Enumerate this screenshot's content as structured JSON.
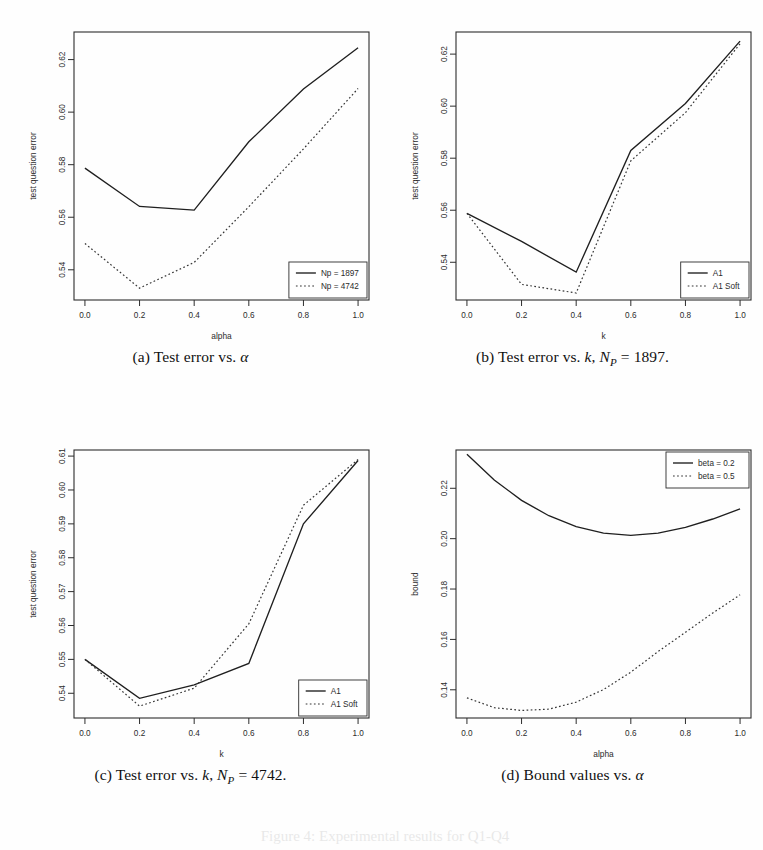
{
  "figure": {
    "background": "#fefefe",
    "ink_color": "#1f1f1f"
  },
  "panels": [
    {
      "id": "a",
      "caption_prefix": "(a)",
      "caption_text": "Test error vs.",
      "caption_symbol": "α",
      "caption_suffix": ""
    },
    {
      "id": "b",
      "caption_prefix": "(b)",
      "caption_text": "Test error vs.",
      "caption_symbol": "k",
      "caption_suffix": "1897."
    },
    {
      "id": "c",
      "caption_prefix": "(c)",
      "caption_text": "Test error vs.",
      "caption_symbol": "k",
      "caption_suffix": "4742."
    },
    {
      "id": "d",
      "caption_prefix": "(d)",
      "caption_text": "Bound values vs.",
      "caption_symbol": "α",
      "caption_suffix": ""
    }
  ],
  "caption_np_var": "N",
  "caption_np_sub": "P",
  "caption_eq": "=",
  "bottom_bleed_text": "Figure 4: Experimental results for Q1-Q4",
  "chart_data": [
    {
      "id": "a",
      "type": "line",
      "title": "",
      "xlabel": "alpha",
      "ylabel": "test question error",
      "x": [
        0.0,
        0.2,
        0.4,
        0.6,
        0.8,
        1.0
      ],
      "xticks": [
        "0.0",
        "0.2",
        "0.4",
        "0.6",
        "0.8",
        "1.0"
      ],
      "yticks": [
        "0.54",
        "0.56",
        "0.58",
        "0.60",
        "0.62"
      ],
      "ytickvals": [
        0.54,
        0.56,
        0.58,
        0.6,
        0.62
      ],
      "xlim": [
        -0.04,
        1.04
      ],
      "ylim": [
        0.5285,
        0.6305
      ],
      "grid": false,
      "legend_position": "bottom-right",
      "series": [
        {
          "name": "Np = 1897",
          "style": "solid",
          "values": [
            0.5787,
            0.5641,
            0.5627,
            0.5887,
            0.6088,
            0.6245
          ]
        },
        {
          "name": "Np = 4742",
          "style": "dotted",
          "values": [
            0.55,
            0.533,
            0.5428,
            0.564,
            0.586,
            0.609
          ]
        }
      ]
    },
    {
      "id": "b",
      "type": "line",
      "title": "",
      "xlabel": "k",
      "ylabel": "test question error",
      "x": [
        0.0,
        0.2,
        0.4,
        0.6,
        0.8,
        1.0
      ],
      "xticks": [
        "0.0",
        "0.2",
        "0.4",
        "0.6",
        "0.8",
        "1.0"
      ],
      "yticks": [
        "0.54",
        "0.56",
        "0.58",
        "0.60",
        "0.62"
      ],
      "ytickvals": [
        0.54,
        0.56,
        0.58,
        0.6,
        0.62
      ],
      "xlim": [
        -0.04,
        1.04
      ],
      "ylim": [
        0.5255,
        0.6285
      ],
      "grid": false,
      "legend_position": "bottom-right",
      "series": [
        {
          "name": "A1",
          "style": "solid",
          "values": [
            0.5588,
            0.548,
            0.5362,
            0.583,
            0.601,
            0.625
          ]
        },
        {
          "name": "A1 Soft",
          "style": "dotted",
          "values": [
            0.5588,
            0.5315,
            0.5282,
            0.579,
            0.5975,
            0.624
          ]
        }
      ]
    },
    {
      "id": "c",
      "type": "line",
      "title": "",
      "xlabel": "k",
      "ylabel": "test question error",
      "x": [
        0.0,
        0.2,
        0.4,
        0.6,
        0.8,
        1.0
      ],
      "xticks": [
        "0.0",
        "0.2",
        "0.4",
        "0.6",
        "0.8",
        "1.0"
      ],
      "yticks": [
        "0.54",
        "0.55",
        "0.56",
        "0.57",
        "0.58",
        "0.59",
        "0.60",
        "0.61"
      ],
      "ytickvals": [
        0.54,
        0.55,
        0.56,
        0.57,
        0.58,
        0.59,
        0.6,
        0.61
      ],
      "xlim": [
        -0.04,
        1.04
      ],
      "ylim": [
        0.5327,
        0.6118
      ],
      "grid": false,
      "legend_position": "bottom-right",
      "series": [
        {
          "name": "A1",
          "style": "solid",
          "values": [
            0.55,
            0.5385,
            0.5425,
            0.5488,
            0.59,
            0.6087
          ]
        },
        {
          "name": "A1 Soft",
          "style": "dotted",
          "values": [
            0.55,
            0.5362,
            0.5415,
            0.5605,
            0.5955,
            0.609
          ]
        }
      ]
    },
    {
      "id": "d",
      "type": "line",
      "title": "",
      "xlabel": "alpha",
      "ylabel": "bound",
      "x": [
        0.0,
        0.1,
        0.2,
        0.3,
        0.4,
        0.5,
        0.6,
        0.7,
        0.8,
        0.9,
        1.0
      ],
      "xticks": [
        "0.0",
        "0.2",
        "0.4",
        "0.6",
        "0.8",
        "1.0"
      ],
      "xtickvals": [
        0.0,
        0.2,
        0.4,
        0.6,
        0.8,
        1.0
      ],
      "yticks": [
        "0.14",
        "0.16",
        "0.18",
        "0.20",
        "0.22"
      ],
      "ytickvals": [
        0.14,
        0.16,
        0.18,
        0.2,
        0.22
      ],
      "xlim": [
        -0.04,
        1.04
      ],
      "ylim": [
        0.1288,
        0.2352
      ],
      "grid": false,
      "legend_position": "top-right",
      "series": [
        {
          "name": "beta = 0.2",
          "style": "solid",
          "values": [
            0.2335,
            0.2233,
            0.2152,
            0.2091,
            0.2048,
            0.2022,
            0.2013,
            0.2022,
            0.2045,
            0.2078,
            0.2118
          ]
        },
        {
          "name": "beta = 0.5",
          "style": "dotted",
          "values": [
            0.1368,
            0.1329,
            0.1318,
            0.1323,
            0.1351,
            0.1401,
            0.147,
            0.1552,
            0.1628,
            0.1705,
            0.1777
          ]
        }
      ]
    }
  ]
}
